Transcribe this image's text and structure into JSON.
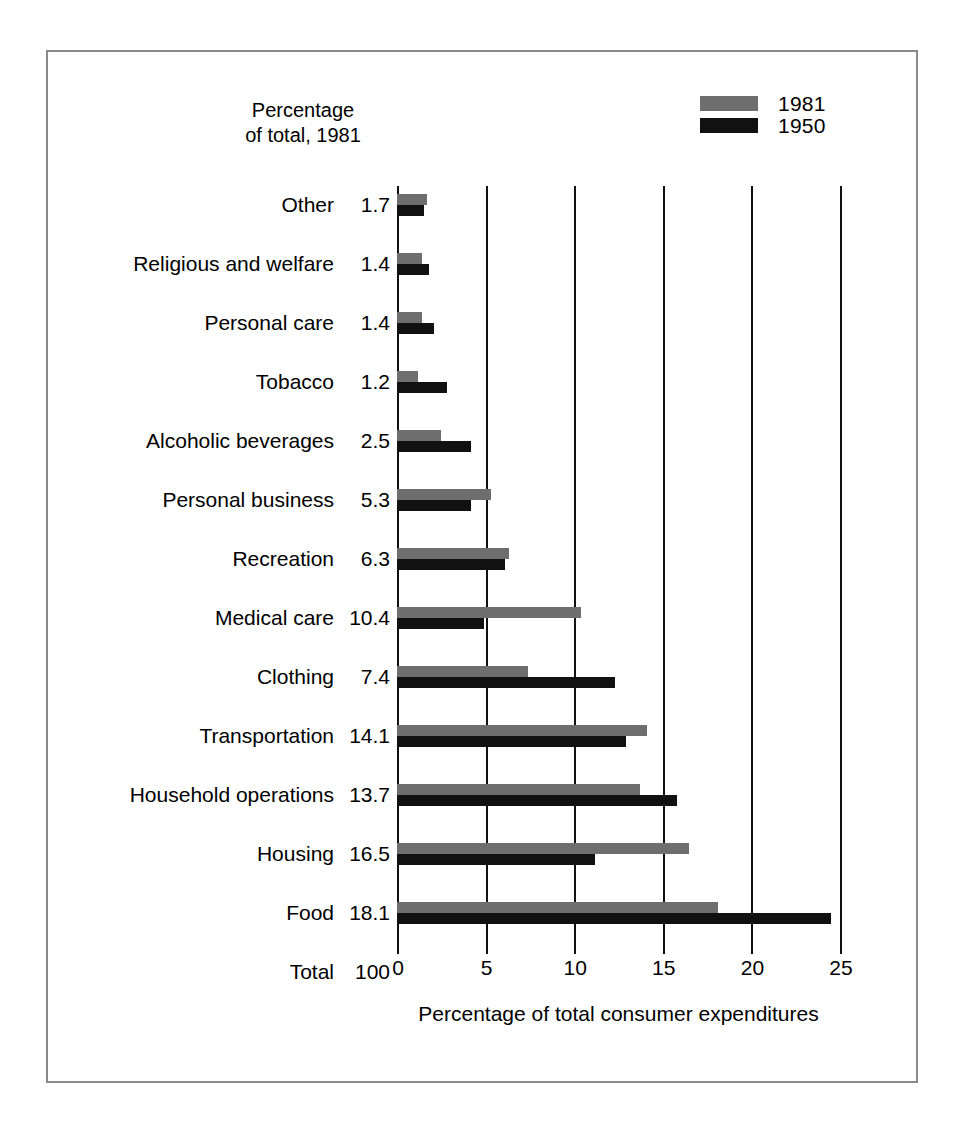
{
  "figure": {
    "axis_header": "Percentage\nof total, 1981",
    "x_axis_title": "Percentage of total consumer expenditures",
    "frame_color": "#8a8a8a"
  },
  "legend": {
    "position": "top-right",
    "entries": [
      {
        "label": "1981",
        "color": "#6e6e6e",
        "swatch_name": "legend-swatch-1981"
      },
      {
        "label": "1950",
        "color": "#111111",
        "swatch_name": "legend-swatch-1950"
      }
    ]
  },
  "chart_data": {
    "type": "bar",
    "orientation": "horizontal",
    "title": "",
    "subtitle": "",
    "xlabel": "Percentage of total consumer expenditures",
    "ylabel": "",
    "xlim": [
      0,
      25
    ],
    "xticks": [
      0,
      5,
      10,
      15,
      20,
      25
    ],
    "xtick_labels": [
      "0",
      "5",
      "10",
      "15",
      "20",
      "25"
    ],
    "grid": "vertical gridlines at every x tick",
    "legend_position": "top right",
    "categories": [
      "Other",
      "Religious and welfare",
      "Personal care",
      "Tobacco",
      "Alcoholic beverages",
      "Personal business",
      "Recreation",
      "Medical care",
      "Clothing",
      "Transportation",
      "Household operations",
      "Housing",
      "Food",
      "Total"
    ],
    "percent_of_total_1981_labels": [
      "1.7",
      "1.4",
      "1.4",
      "1.2",
      "2.5",
      "5.3",
      "6.3",
      "10.4",
      "7.4",
      "14.1",
      "13.7",
      "16.5",
      "18.1",
      "100"
    ],
    "series": [
      {
        "name": "1981",
        "color": "#6e6e6e",
        "values": [
          1.7,
          1.4,
          1.4,
          1.2,
          2.5,
          5.3,
          6.3,
          10.4,
          7.4,
          14.1,
          13.7,
          16.5,
          18.1,
          null
        ]
      },
      {
        "name": "1950",
        "color": "#111111",
        "values": [
          1.5,
          1.8,
          2.1,
          2.8,
          4.2,
          4.2,
          6.1,
          4.9,
          12.3,
          12.9,
          15.8,
          11.2,
          24.5,
          null
        ]
      }
    ]
  }
}
